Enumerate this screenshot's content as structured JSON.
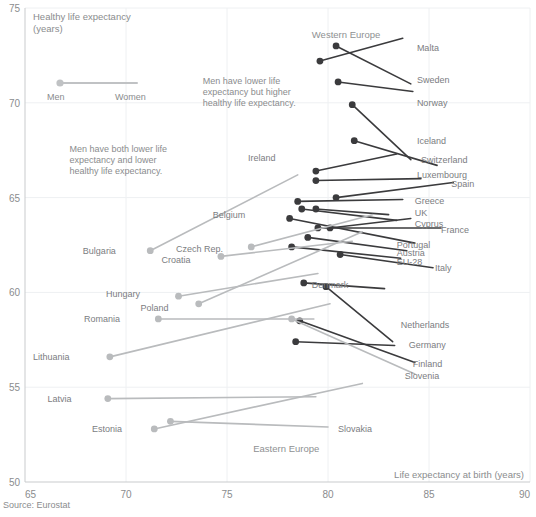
{
  "chart_data": {
    "type": "scatter",
    "title": "",
    "xlabel": "Life expectancy at birth (years)",
    "ylabel": "Healthy life expectancy (years)",
    "ylabel_line1": "Healthy life expectancy",
    "ylabel_line2": "(years)",
    "xlim": [
      65,
      90
    ],
    "ylim": [
      50,
      75
    ],
    "xticks": [
      65,
      70,
      75,
      80,
      85,
      90
    ],
    "yticks": [
      50,
      55,
      60,
      65,
      70,
      75
    ],
    "grid": true,
    "legend_position": "top-left",
    "source": "Source: Eurostat",
    "colors": {
      "western": "#3b3b3d",
      "eastern": "#b9bbbd",
      "legend": "#c0c2c4",
      "text": "#808285",
      "grid": "#eef0f2"
    },
    "legend": {
      "men_label": "Men",
      "women_label": "Women",
      "note": "dot marks men, line end marks women"
    },
    "group_labels": [
      {
        "text": "Western Europe",
        "x": 79.2,
        "y": 73.4
      },
      {
        "text": "Eastern Europe",
        "x": 76.3,
        "y": 51.6
      }
    ],
    "annotations": [
      {
        "id": "annot-higher-hle",
        "lines": [
          "Men have lower life",
          "expectancy but higher",
          "healthy life expectancy."
        ],
        "x": 73.8,
        "y": 71.0
      },
      {
        "id": "annot-lower-both",
        "lines": [
          "Men have both lower life",
          "expectancy and lower",
          "healthy life expectancy."
        ],
        "x": 67.2,
        "y": 67.4
      }
    ],
    "series": [
      {
        "name": "Western Europe",
        "color": "#3b3b3d",
        "points": [
          {
            "country": "Malta",
            "men_le": 79.6,
            "men_hle": 72.2,
            "women_le": 83.7,
            "women_hle": 73.4,
            "label_x": 84.4,
            "label_y": 72.9
          },
          {
            "country": "Sweden",
            "men_le": 80.4,
            "men_hle": 73.0,
            "women_le": 84.1,
            "women_hle": 71.0,
            "label_x": 84.4,
            "label_y": 71.2
          },
          {
            "country": "Norway",
            "men_le": 80.5,
            "men_hle": 71.1,
            "women_le": 84.2,
            "women_hle": 70.6,
            "label_x": 84.4,
            "label_y": 70.0
          },
          {
            "country": "Iceland",
            "men_le": 81.2,
            "men_hle": 69.9,
            "women_le": 84.1,
            "women_hle": 67.0,
            "label_x": 84.4,
            "label_y": 68.0
          },
          {
            "country": "Switzerland",
            "men_le": 81.3,
            "men_hle": 68.0,
            "women_le": 85.4,
            "women_hle": 66.7,
            "label_x": 84.6,
            "label_y": 67.0
          },
          {
            "country": "Ireland",
            "men_le": 79.4,
            "men_hle": 66.4,
            "women_le": 83.4,
            "women_hle": 67.3,
            "label_x": 77.4,
            "label_y": 67.1
          },
          {
            "country": "Luxembourg",
            "men_le": 79.4,
            "men_hle": 65.9,
            "women_le": 84.6,
            "women_hle": 66.0,
            "label_x": 84.4,
            "label_y": 66.2
          },
          {
            "country": "Spain",
            "men_le": 80.4,
            "men_hle": 65.0,
            "women_le": 86.2,
            "women_hle": 65.8,
            "label_x": 86.1,
            "label_y": 65.7
          },
          {
            "country": "Greece",
            "men_le": 78.5,
            "men_hle": 64.8,
            "women_le": 83.7,
            "women_hle": 64.9,
            "label_x": 84.3,
            "label_y": 64.8
          },
          {
            "country": "UK",
            "men_le": 79.4,
            "men_hle": 64.4,
            "women_le": 83.0,
            "women_hle": 64.1,
            "label_x": 84.3,
            "label_y": 64.2
          },
          {
            "country": "Cyprus",
            "men_le": 80.1,
            "men_hle": 63.4,
            "women_le": 84.1,
            "women_hle": 63.9,
            "label_x": 84.3,
            "label_y": 63.6
          },
          {
            "country": "France",
            "men_le": 79.5,
            "men_hle": 63.4,
            "women_le": 85.6,
            "women_hle": 63.4,
            "label_x": 85.6,
            "label_y": 63.3
          },
          {
            "country": "Belgium",
            "men_le": 78.7,
            "men_hle": 64.4,
            "women_le": 83.4,
            "women_hle": 63.8,
            "label_x": 75.9,
            "label_y": 64.1
          },
          {
            "country": "Portugal",
            "men_le": 78.1,
            "men_hle": 63.9,
            "women_le": 84.3,
            "women_hle": 62.6,
            "label_x": 83.4,
            "label_y": 62.5
          },
          {
            "country": "Austria",
            "men_le": 79.0,
            "men_hle": 62.9,
            "women_le": 83.9,
            "women_hle": 62.2,
            "label_x": 83.4,
            "label_y": 62.1
          },
          {
            "country": "EU-28",
            "men_le": 78.2,
            "men_hle": 62.4,
            "women_le": 83.6,
            "women_hle": 61.8,
            "label_x": 83.4,
            "label_y": 61.6
          },
          {
            "country": "Italy",
            "men_le": 80.6,
            "men_hle": 62.0,
            "women_le": 85.2,
            "women_hle": 61.3,
            "label_x": 85.3,
            "label_y": 61.3
          },
          {
            "country": "Denmark",
            "men_le": 78.8,
            "men_hle": 60.5,
            "women_le": 82.8,
            "women_hle": 60.2,
            "label_x": 79.2,
            "label_y": 60.4
          },
          {
            "country": "Netherlands",
            "men_le": 79.9,
            "men_hle": 60.3,
            "women_le": 83.2,
            "women_hle": 57.4,
            "label_x": 83.6,
            "label_y": 58.3
          },
          {
            "country": "Germany",
            "men_le": 78.4,
            "men_hle": 57.4,
            "women_le": 83.3,
            "women_hle": 57.2,
            "label_x": 84.0,
            "label_y": 57.2
          },
          {
            "country": "Finland",
            "men_le": 78.6,
            "men_hle": 58.5,
            "women_le": 84.3,
            "women_hle": 56.3,
            "label_x": 84.2,
            "label_y": 56.2
          }
        ]
      },
      {
        "name": "Eastern Europe",
        "color": "#b9bbbd",
        "points": [
          {
            "country": "Slovenia",
            "men_le": 78.2,
            "men_hle": 58.6,
            "women_le": 84.3,
            "women_hle": 55.7,
            "label_x": 83.8,
            "label_y": 55.6
          },
          {
            "country": "Bulgaria",
            "men_le": 71.2,
            "men_hle": 62.2,
            "women_le": 78.5,
            "women_hle": 66.2,
            "label_x": 69.5,
            "label_y": 62.2
          },
          {
            "country": "Croatia",
            "men_le": 74.7,
            "men_hle": 61.9,
            "women_le": 81.2,
            "women_hle": 62.7,
            "label_x": 73.2,
            "label_y": 61.7
          },
          {
            "country": "Czech Rep.",
            "men_le": 76.2,
            "men_hle": 62.4,
            "women_le": 82.2,
            "women_hle": 64.1,
            "label_x": 74.8,
            "label_y": 62.3
          },
          {
            "country": "Hungary",
            "men_le": 72.6,
            "men_hle": 59.8,
            "women_le": 79.5,
            "women_hle": 61.0,
            "label_x": 70.7,
            "label_y": 59.9
          },
          {
            "country": "Poland",
            "men_le": 73.6,
            "men_hle": 59.4,
            "women_le": 81.7,
            "women_hle": 63.2,
            "label_x": 72.1,
            "label_y": 59.2
          },
          {
            "country": "Romania",
            "men_le": 71.6,
            "men_hle": 58.6,
            "women_le": 79.3,
            "women_hle": 58.6,
            "label_x": 69.7,
            "label_y": 58.6
          },
          {
            "country": "Lithuania",
            "men_le": 69.2,
            "men_hle": 56.6,
            "women_le": 80.1,
            "women_hle": 59.4,
            "label_x": 67.2,
            "label_y": 56.6
          },
          {
            "country": "Latvia",
            "men_le": 69.1,
            "men_hle": 54.4,
            "women_le": 79.4,
            "women_hle": 54.5,
            "label_x": 67.3,
            "label_y": 54.4
          },
          {
            "country": "Estonia",
            "men_le": 71.4,
            "men_hle": 52.8,
            "women_le": 81.7,
            "women_hle": 55.2,
            "label_x": 69.8,
            "label_y": 52.8
          },
          {
            "country": "Slovakia",
            "men_le": 72.2,
            "men_hle": 53.2,
            "women_le": 80.0,
            "women_hle": 52.9,
            "label_x": 80.5,
            "label_y": 52.8
          }
        ]
      }
    ]
  }
}
